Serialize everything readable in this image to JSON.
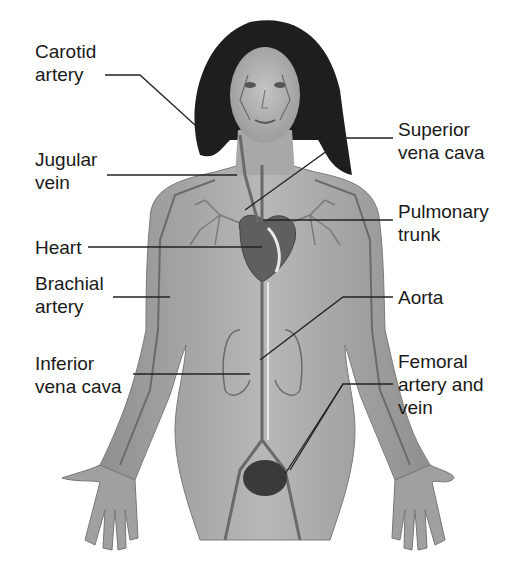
{
  "diagram": {
    "colors": {
      "background": "#ffffff",
      "text": "#1a1a1a",
      "leader_line": "#222222",
      "skin": "#a9a9a9",
      "hair": "#1e1e1e",
      "vessel": "#6e6e6e"
    },
    "labels": [
      {
        "id": "carotid-artery",
        "lines": [
          "Carotid",
          "artery"
        ],
        "side": "left"
      },
      {
        "id": "jugular-vein",
        "lines": [
          "Jugular",
          "vein"
        ],
        "side": "left"
      },
      {
        "id": "heart",
        "lines": [
          "Heart"
        ],
        "side": "left"
      },
      {
        "id": "brachial-artery",
        "lines": [
          "Brachial",
          "artery"
        ],
        "side": "left"
      },
      {
        "id": "inferior-vena-cava",
        "lines": [
          "Inferior",
          "vena cava"
        ],
        "side": "left"
      },
      {
        "id": "superior-vena-cava",
        "lines": [
          "Superior",
          "vena cava"
        ],
        "side": "right"
      },
      {
        "id": "pulmonary-trunk",
        "lines": [
          "Pulmonary",
          "trunk"
        ],
        "side": "right"
      },
      {
        "id": "aorta",
        "lines": [
          "Aorta"
        ],
        "side": "right"
      },
      {
        "id": "femoral-artery-and-vein",
        "lines": [
          "Femoral",
          "artery and",
          "vein"
        ],
        "side": "right"
      }
    ]
  }
}
